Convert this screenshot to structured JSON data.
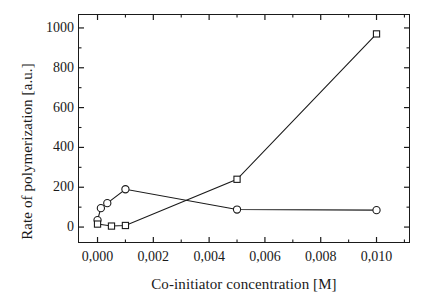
{
  "chart_data": {
    "type": "line",
    "title": "",
    "xlabel": "Co-initiator concentration [M]",
    "ylabel": "Rate of polymerization [a.u.]",
    "xlim": [
      -0.0007,
      0.0112
    ],
    "ylim": [
      -80,
      1070
    ],
    "grid": false,
    "legend": "none",
    "decimal_separator": ",",
    "xticks": [
      {
        "value": 0.0,
        "label": "0,000"
      },
      {
        "value": 0.002,
        "label": "0,002"
      },
      {
        "value": 0.004,
        "label": "0,004"
      },
      {
        "value": 0.006,
        "label": "0,006"
      },
      {
        "value": 0.008,
        "label": "0,008"
      },
      {
        "value": 0.01,
        "label": "0,010"
      }
    ],
    "xminor_ticks": [
      0.001,
      0.003,
      0.005,
      0.007,
      0.009,
      0.011
    ],
    "yticks": [
      {
        "value": 0,
        "label": "0"
      },
      {
        "value": 200,
        "label": "200"
      },
      {
        "value": 400,
        "label": "400"
      },
      {
        "value": 600,
        "label": "600"
      },
      {
        "value": 800,
        "label": "800"
      },
      {
        "value": 1000,
        "label": "1000"
      }
    ],
    "yminor_ticks": [
      100,
      300,
      500,
      700,
      900
    ],
    "series": [
      {
        "name": "circle-series",
        "marker": "open-circle",
        "color": "#1a1a1a",
        "x": [
          0.0,
          0.00012,
          0.00035,
          0.001,
          0.005,
          0.01
        ],
        "y": [
          35,
          95,
          120,
          190,
          88,
          85
        ]
      },
      {
        "name": "square-series",
        "marker": "open-square",
        "color": "#1a1a1a",
        "x": [
          0.0,
          0.0005,
          0.001,
          0.005,
          0.01
        ],
        "y": [
          15,
          5,
          8,
          240,
          970
        ]
      }
    ]
  },
  "figure": {
    "background": "#ffffff",
    "axis_color": "#1a1a1a"
  }
}
